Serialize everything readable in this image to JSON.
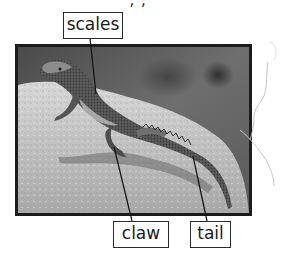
{
  "page": {
    "top_text_fragment": "· , , · · · ·",
    "background_color": "#ffffff"
  },
  "figure": {
    "photo_style": "grayscale",
    "frame_color": "#1c1c1c"
  },
  "labels": [
    {
      "id": "scales",
      "text": "scales"
    },
    {
      "id": "claw",
      "text": "claw"
    },
    {
      "id": "tail",
      "text": "tail"
    }
  ]
}
